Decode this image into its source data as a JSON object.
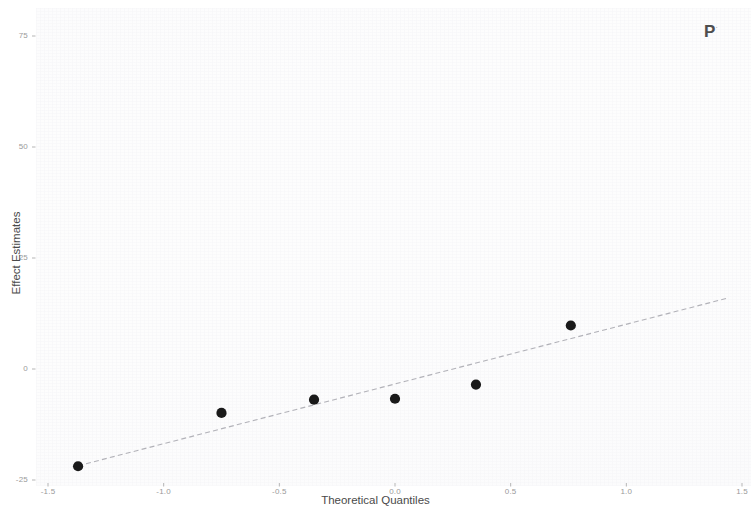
{
  "chart_data": {
    "type": "scatter",
    "title": "",
    "subtitle": "",
    "xlabel": "Theoretical Quantiles",
    "ylabel": "Effect Estimates",
    "xlim": [
      -1.55,
      1.55
    ],
    "ylim": [
      -27,
      80
    ],
    "xticks": [
      -1.5,
      -1.0,
      -0.5,
      0.0,
      0.5,
      1.0,
      1.5
    ],
    "xticklabels": [
      "-1.5",
      "-1.0",
      "-0.5",
      "0.0",
      "0.5",
      "1.0",
      "1.5"
    ],
    "yticks": [
      -25,
      0,
      25,
      50,
      75
    ],
    "yticklabels": [
      "-25",
      "0",
      "25",
      "50",
      "75"
    ],
    "grid": false,
    "legend": null,
    "panel_label": "P",
    "panel_label_sup": "·",
    "point_color": "#1a1a1a",
    "line_color": "#9e9ea6",
    "background_color": "#fdfdfd",
    "series": [
      {
        "name": "Effect estimates",
        "marker": "filled-circle",
        "x": [
          -1.37,
          -0.75,
          -0.35,
          0.0,
          0.35,
          0.76
        ],
        "y": [
          -21.9,
          -9.9,
          -6.9,
          -6.7,
          -3.5,
          9.8
        ]
      }
    ],
    "reference_line": {
      "name": "qq-reference-line",
      "style": "dashed",
      "x": [
        -1.37,
        1.44
      ],
      "y": [
        -21.8,
        16.0
      ]
    }
  },
  "axis": {
    "x": {
      "title": "Theoretical Quantiles",
      "ticks": [
        {
          "label": "-1.5",
          "value": -1.5
        },
        {
          "label": "-1.0",
          "value": -1.0
        },
        {
          "label": "-0.5",
          "value": -0.5
        },
        {
          "label": "0.0",
          "value": 0.0
        },
        {
          "label": "0.5",
          "value": 0.5
        },
        {
          "label": "1.0",
          "value": 1.0
        },
        {
          "label": "1.5",
          "value": 1.5
        }
      ]
    },
    "y": {
      "title": "Effect Estimates",
      "ticks": [
        {
          "label": "75",
          "value": 75
        },
        {
          "label": "50",
          "value": 50
        },
        {
          "label": "25",
          "value": 25
        },
        {
          "label": "0",
          "value": 0
        },
        {
          "label": "-25",
          "value": -25
        }
      ]
    }
  },
  "panel": {
    "tag": "P",
    "tag_sup": "·"
  }
}
